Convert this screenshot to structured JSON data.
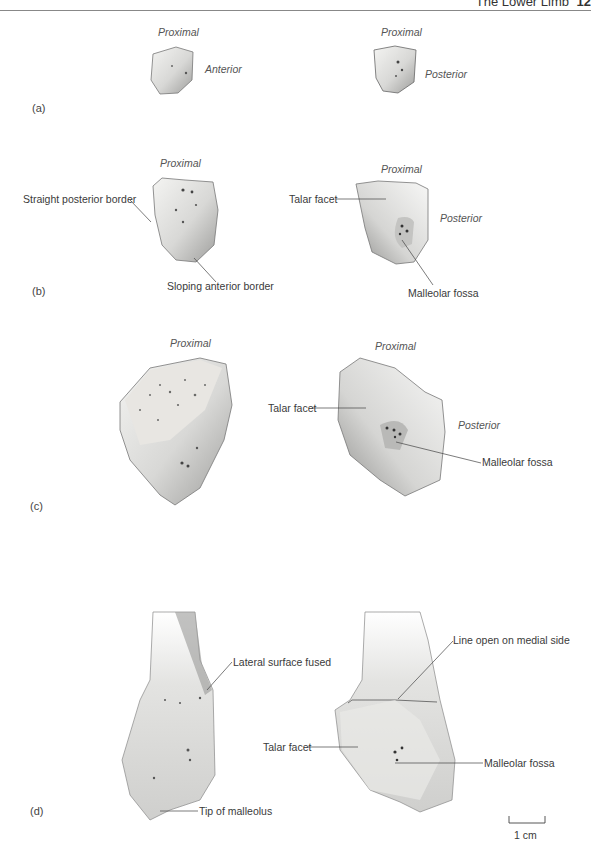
{
  "header": {
    "title": "The Lower Limb",
    "page_number": "12"
  },
  "panels": {
    "a": {
      "letter": "(a)",
      "left": {
        "top_label": "Proximal",
        "side_label": "Anterior"
      },
      "right": {
        "top_label": "Proximal",
        "side_label": "Posterior"
      }
    },
    "b": {
      "letter": "(b)",
      "left": {
        "top_label": "Proximal",
        "callouts": [
          "Straight posterior border",
          "Sloping anterior border"
        ]
      },
      "right": {
        "top_label": "Proximal",
        "side_label": "Posterior",
        "callouts": [
          "Talar facet",
          "Malleolar fossa"
        ]
      }
    },
    "c": {
      "letter": "(c)",
      "left": {
        "top_label": "Proximal"
      },
      "right": {
        "top_label": "Proximal",
        "side_label": "Posterior",
        "callouts": [
          "Talar facet",
          "Malleolar fossa"
        ]
      }
    },
    "d": {
      "letter": "(d)",
      "left": {
        "callouts": [
          "Lateral surface fused",
          "Tip of malleolus"
        ]
      },
      "right": {
        "callouts": [
          "Line open on medial side",
          "Talar facet",
          "Malleolar fossa"
        ]
      }
    }
  },
  "scale": {
    "label": "1 cm"
  }
}
